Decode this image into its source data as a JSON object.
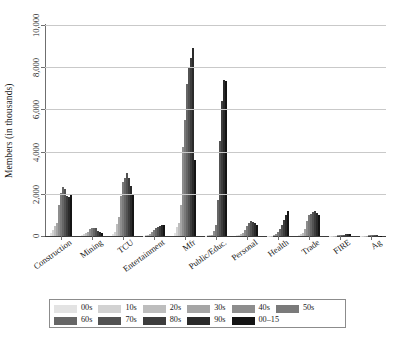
{
  "chart_data": {
    "type": "bar",
    "title": "",
    "subtitle": "",
    "xlabel": "",
    "ylabel": "Members (in thousands)",
    "ylim": [
      0,
      10000
    ],
    "yticks": [
      0,
      2000,
      4000,
      6000,
      8000,
      10000
    ],
    "ytick_labels": [
      "0",
      "2,000",
      "4,000",
      "6,000",
      "8,000",
      "10,000"
    ],
    "grid": "horizontal",
    "legend_position": "bottom",
    "categories": [
      "Construction",
      "Mining",
      "TCU",
      "Entertainment",
      "Mfr",
      "Public/Educ.",
      "Personal",
      "Health",
      "Trade",
      "FIRE",
      "Ag"
    ],
    "series": [
      {
        "name": "00s",
        "color": "#e3e3e3",
        "values": [
          120,
          60,
          95,
          20,
          150,
          15,
          30,
          10,
          45,
          5,
          8
        ]
      },
      {
        "name": "10s",
        "color": "#d2d2d2",
        "values": [
          300,
          110,
          210,
          35,
          420,
          25,
          55,
          15,
          100,
          8,
          12
        ]
      },
      {
        "name": "20s",
        "color": "#bdbdbd",
        "values": [
          460,
          150,
          560,
          50,
          600,
          40,
          80,
          20,
          160,
          10,
          15
        ]
      },
      {
        "name": "30s",
        "color": "#a5a5a5",
        "values": [
          640,
          200,
          900,
          90,
          1450,
          70,
          130,
          40,
          320,
          15,
          20
        ]
      },
      {
        "name": "40s",
        "color": "#8d8d8d",
        "values": [
          1450,
          330,
          1900,
          210,
          4200,
          230,
          300,
          100,
          700,
          25,
          30
        ]
      },
      {
        "name": "50s",
        "color": "#7a7a7a",
        "values": [
          2050,
          390,
          2550,
          300,
          5500,
          520,
          480,
          210,
          980,
          35,
          35
        ]
      },
      {
        "name": "60s",
        "color": "#666666",
        "values": [
          2300,
          400,
          2750,
          360,
          7200,
          1700,
          620,
          330,
          1050,
          45,
          35
        ]
      },
      {
        "name": "70s",
        "color": "#525252",
        "values": [
          2250,
          360,
          3000,
          420,
          8000,
          4500,
          700,
          500,
          1150,
          60,
          30
        ]
      },
      {
        "name": "80s",
        "color": "#3d3d3d",
        "values": [
          1900,
          250,
          2750,
          470,
          8450,
          6400,
          680,
          760,
          1200,
          80,
          25
        ]
      },
      {
        "name": "90s",
        "color": "#2a2a2a",
        "values": [
          1850,
          190,
          2350,
          500,
          8900,
          7400,
          600,
          1000,
          1100,
          95,
          20
        ]
      },
      {
        "name": "00-15",
        "color": "#141414",
        "values": [
          1950,
          140,
          1980,
          520,
          3600,
          7350,
          520,
          1180,
          1000,
          110,
          18
        ]
      }
    ]
  },
  "legend": {
    "rows": [
      [
        "00s",
        "10s",
        "20s",
        "30s",
        "40s",
        "50s"
      ],
      [
        "60s",
        "70s",
        "80s",
        "90s",
        "00–15"
      ]
    ]
  },
  "colors": {
    "axis": "#3c3c3c",
    "grid": "#c9c9c9",
    "text": "#1a1a1a",
    "background": "#ffffff",
    "legend_border": "#8c8c8c"
  }
}
